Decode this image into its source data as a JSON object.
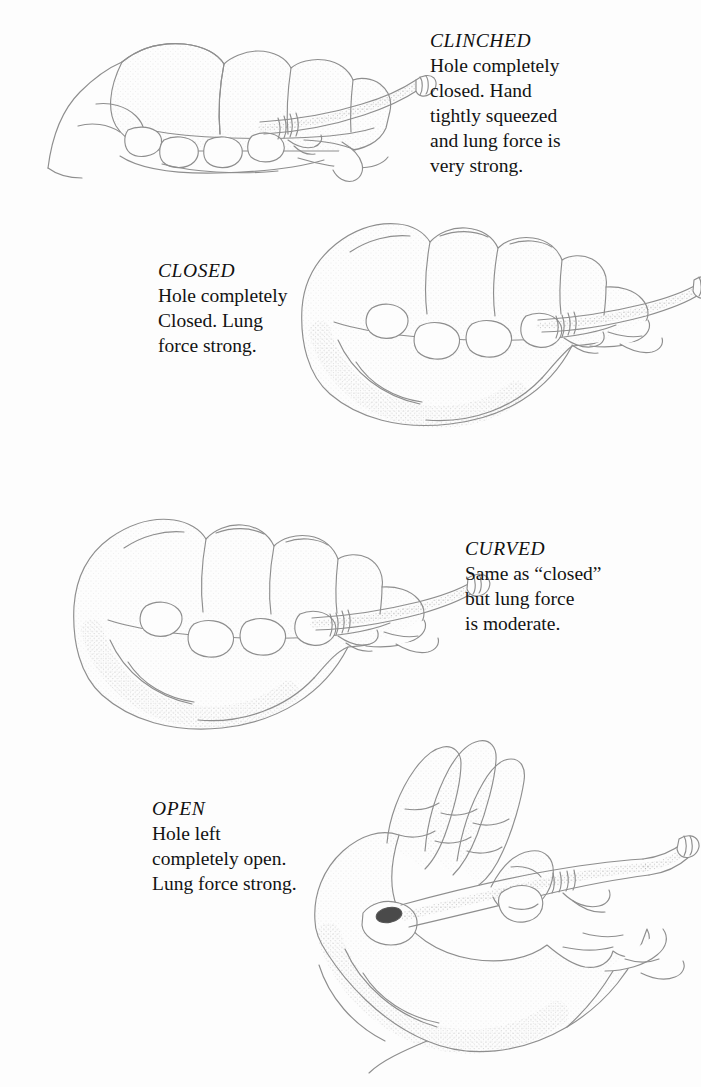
{
  "document": {
    "kind": "instructional-illustration",
    "subject": "hand grip positions on a tube mouthpiece",
    "background_color": "#fdfdfd",
    "line_color": "#8e8e8e",
    "text_color": "#131313",
    "panel_count": 4
  },
  "panels": [
    {
      "id": "clinched",
      "title": "CLINCHED",
      "lines": [
        "Hole completely",
        "closed. Hand",
        "tightly squeezed",
        "and lung force is",
        "very strong."
      ],
      "caption_side": "right",
      "illustration_name": "clinched-fist-grip-illustration",
      "hand_state": "tight fist, fingers fully curled, hole sealed"
    },
    {
      "id": "closed",
      "title": "CLOSED",
      "lines": [
        "Hole completely",
        "Closed. Lung",
        "force strong."
      ],
      "caption_side": "left",
      "illustration_name": "closed-fist-grip-illustration",
      "hand_state": "relaxed fist, fingers curled, hole sealed"
    },
    {
      "id": "curved",
      "title": "CURVED",
      "lines": [
        "Same as “closed”",
        "but lung force",
        "is moderate."
      ],
      "caption_side": "right",
      "illustration_name": "curved-hand-grip-illustration",
      "hand_state": "curved fingers, hole sealed, lighter grip"
    },
    {
      "id": "open",
      "title": "OPEN",
      "lines": [
        "Hole left",
        "completely open.",
        "Lung force strong."
      ],
      "caption_side": "left",
      "illustration_name": "open-hand-grip-illustration",
      "hand_state": "fingers extended upward, tube hole exposed"
    }
  ]
}
